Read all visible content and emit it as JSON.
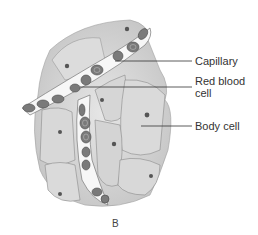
{
  "figure": {
    "panel_letter": "B",
    "labels": [
      {
        "id": "capillary",
        "text": "Capillary"
      },
      {
        "id": "red-blood-cell",
        "lines": [
          "Red blood",
          "cell"
        ]
      },
      {
        "id": "body-cell",
        "text": "Body cell"
      }
    ]
  },
  "colors": {
    "background": "#ffffff",
    "cell_fill": "#d9d9d9",
    "cell_edge": "#8a8a8a",
    "rbc_fill": "#7a7a7a",
    "nucleus": "#555555",
    "leader_line": "#333333",
    "text": "#333333"
  }
}
